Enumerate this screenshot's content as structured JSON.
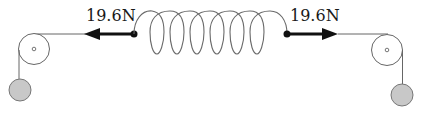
{
  "diagram": {
    "title": "",
    "type": "spring-pulley-force-diagram",
    "forces": {
      "left": {
        "label": "19.6N",
        "direction": "left"
      },
      "right": {
        "label": "19.6N",
        "direction": "right"
      }
    },
    "spring": {
      "coils": 7
    },
    "pulleys": [
      {
        "position": "left"
      },
      {
        "position": "right"
      }
    ],
    "masses": [
      {
        "position": "left",
        "color": "#c8c8c8"
      },
      {
        "position": "right",
        "color": "#c8c8c8"
      }
    ],
    "colors": {
      "line": "#555555",
      "arrow": "#111111",
      "mass_fill": "#c8c8c8",
      "mass_stroke": "#777777",
      "spring": "#6a6a6a"
    }
  }
}
